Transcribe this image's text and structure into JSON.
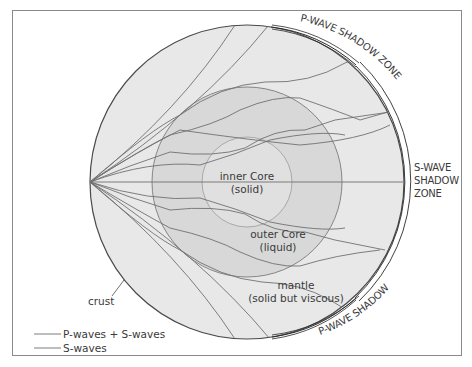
{
  "diagram": {
    "type": "earth-seismic-wave-cross-section",
    "layers": {
      "inner_core": {
        "label_line1": "inner Core",
        "label_line2": "(solid)",
        "fill": "#e2e2e2"
      },
      "outer_core": {
        "label_line1": "outer Core",
        "label_line2": "(liquid)",
        "fill": "#d6d6d6"
      },
      "mantle": {
        "label_line1": "mantle",
        "label_line2": "(solid but viscous)",
        "fill": "#e8e8e8"
      },
      "crust": {
        "label": "crust"
      }
    },
    "zones": {
      "p_wave_shadow_top": "P-WAVE SHADOW ZONE",
      "p_wave_shadow_bottom": "P-WAVE SHADOW ZONE",
      "s_wave_shadow_line1": "S-WAVE",
      "s_wave_shadow_line2": "SHADOW",
      "s_wave_shadow_line3": "ZONE"
    },
    "legend": [
      {
        "label": "P-waves + S-waves",
        "color": "#6e6e6e"
      },
      {
        "label": "S-waves",
        "color": "#6e6e6e"
      }
    ],
    "colors": {
      "wave_line": "#707070",
      "circle_outline": "#4a4a4a",
      "shadow_band": "#2a2a2a",
      "frame": "#8a8a8a"
    }
  }
}
